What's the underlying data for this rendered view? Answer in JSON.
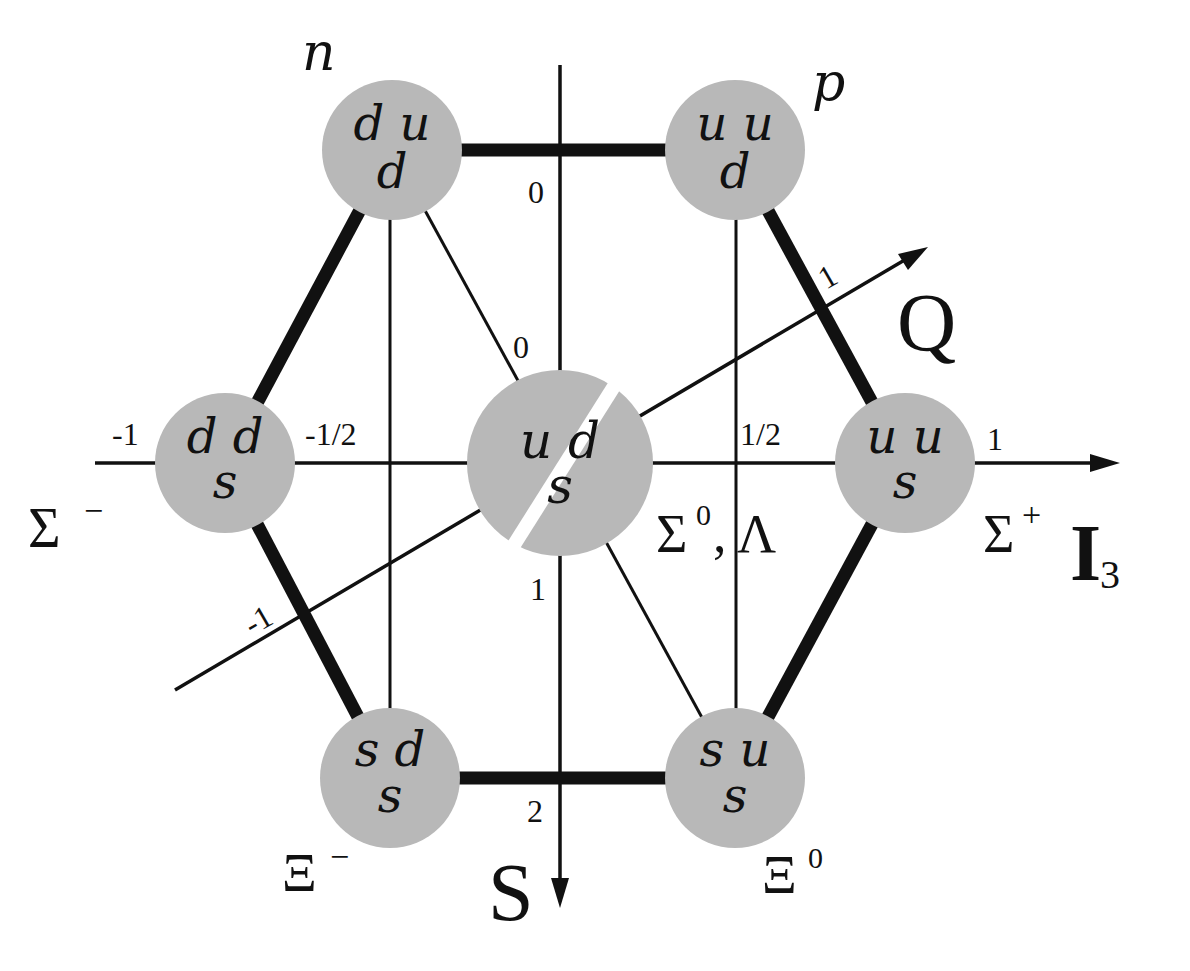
{
  "diagram": {
    "colors": {
      "node_fill": "#b8b8b8",
      "line": "#111111",
      "background": "#ffffff"
    },
    "axes": {
      "I3": {
        "label": "I",
        "subscript": "3",
        "ticks": [
          "-1",
          "-1/2",
          "1/2",
          "1"
        ]
      },
      "S": {
        "label": "S",
        "ticks": [
          "0",
          "1",
          "2"
        ]
      },
      "Q": {
        "label": "Q",
        "ticks": [
          "-1",
          "0",
          "1"
        ]
      }
    },
    "nodes": [
      {
        "id": "n",
        "top": "d u",
        "bottom": "d",
        "name": "n",
        "sup": ""
      },
      {
        "id": "p",
        "top": "u u",
        "bottom": "d",
        "name": "p",
        "sup": ""
      },
      {
        "id": "sigma-minus",
        "top": "d d",
        "bottom": "s",
        "name": "Σ",
        "sup": "−"
      },
      {
        "id": "sigma0-lambda",
        "top": "u d",
        "bottom": "s",
        "name": "Σ",
        "sup": "0",
        "extra": ", Λ"
      },
      {
        "id": "sigma-plus",
        "top": "u u",
        "bottom": "s",
        "name": "Σ",
        "sup": "+"
      },
      {
        "id": "xi-minus",
        "top": "s d",
        "bottom": "s",
        "name": "Ξ",
        "sup": "−"
      },
      {
        "id": "xi-zero",
        "top": "s u",
        "bottom": "s",
        "name": "Ξ",
        "sup": "0"
      }
    ]
  }
}
